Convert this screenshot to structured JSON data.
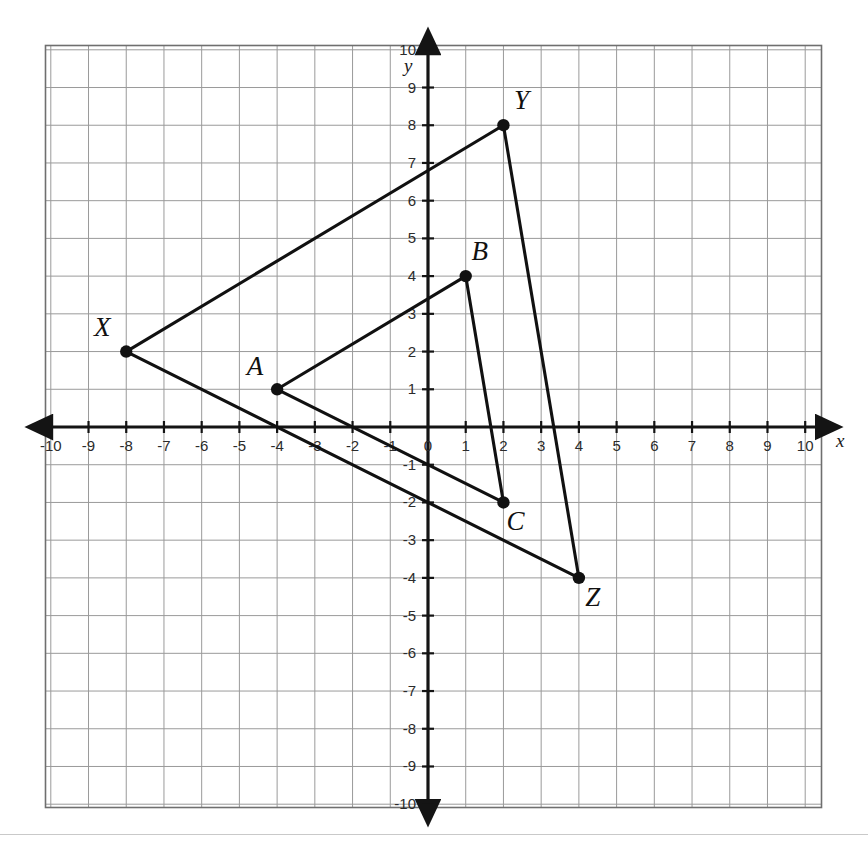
{
  "page": {
    "background_color": "#ffffff",
    "separator_color": "#c9c9c9"
  },
  "chart_data": {
    "type": "scatter",
    "title": "",
    "xlabel": "x",
    "ylabel": "y",
    "xlim": [
      -11,
      11
    ],
    "ylim": [
      -11,
      11
    ],
    "grid": true,
    "grid_step": 1,
    "legend": "none",
    "x_tick_labels": [
      "-10",
      "-9",
      "-8",
      "-7",
      "-6",
      "-5",
      "-4",
      "-3",
      "-2",
      "-1",
      "0",
      "1",
      "2",
      "3",
      "4",
      "5",
      "6",
      "7",
      "8",
      "9",
      "10"
    ],
    "x_tick_values": [
      -10,
      -9,
      -8,
      -7,
      -6,
      -5,
      -4,
      -3,
      -2,
      -1,
      0,
      1,
      2,
      3,
      4,
      5,
      6,
      7,
      8,
      9,
      10
    ],
    "y_tick_labels": [
      "10",
      "9",
      "8",
      "7",
      "6",
      "5",
      "4",
      "3",
      "2",
      "1",
      "-1",
      "-2",
      "-3",
      "-4",
      "-5",
      "-6",
      "-7",
      "-8",
      "-9",
      "-10"
    ],
    "y_tick_values": [
      10,
      9,
      8,
      7,
      6,
      5,
      4,
      3,
      2,
      1,
      -1,
      -2,
      -3,
      -4,
      -5,
      -6,
      -7,
      -8,
      -9,
      -10
    ],
    "series": [
      {
        "name": "Triangle ABC",
        "closed": true,
        "color": "#111111",
        "points": [
          {
            "label": "A",
            "x": -4,
            "y": 1,
            "label_dx": -22,
            "label_dy": -14
          },
          {
            "label": "B",
            "x": 1,
            "y": 4,
            "label_dx": 14,
            "label_dy": -16
          },
          {
            "label": "C",
            "x": 2,
            "y": -2,
            "label_dx": 12,
            "label_dy": 28
          }
        ]
      },
      {
        "name": "Triangle XYZ",
        "closed": true,
        "color": "#111111",
        "points": [
          {
            "label": "X",
            "x": -8,
            "y": 2,
            "label_dx": -24,
            "label_dy": -16
          },
          {
            "label": "Y",
            "x": 2,
            "y": 8,
            "label_dx": 18,
            "label_dy": -16
          },
          {
            "label": "Z",
            "x": 4,
            "y": -4,
            "label_dx": 14,
            "label_dy": 28
          }
        ]
      }
    ],
    "annotations": []
  },
  "axes": {
    "x_axis_label": "x",
    "y_axis_label": "y",
    "origin_label": "0",
    "axis_color": "#141414",
    "grid_color": "#9a9a9a",
    "grid_border_color": "#6f6f6f"
  }
}
